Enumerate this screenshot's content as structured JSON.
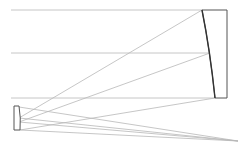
{
  "diagram": {
    "colors": {
      "ray": "#b8b8b8",
      "mirror": "#555555",
      "background": "#ffffff"
    },
    "incoming_rays_y": [
      10,
      53,
      98
    ],
    "primary_mirror": {
      "label": "Primary mirror"
    },
    "secondary_mirror": {
      "label": "Secondary mirror"
    },
    "focal_point": {
      "label": "Focus",
      "x": 238,
      "y": 141
    }
  }
}
